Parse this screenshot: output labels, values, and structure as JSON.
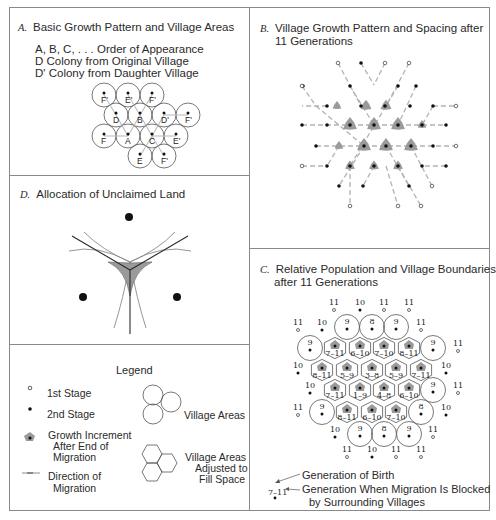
{
  "colors": {
    "border": "#8a8a8a",
    "ink": "#1e1e1e",
    "arrow": "#a6a6a6",
    "shade": "#9a9a9a",
    "circle": "#555555"
  },
  "panel_a": {
    "letter": "A.",
    "title": "Basic Growth Pattern and Village Areas",
    "lines": [
      "A, B, C, . . . Order of Appearance",
      "D Colony from Original Village",
      "D' Colony from Daughter Village"
    ],
    "villages": [
      {
        "label": "F'",
        "x": 104,
        "y": 95
      },
      {
        "label": "E'",
        "x": 128,
        "y": 95
      },
      {
        "label": "F'",
        "x": 152,
        "y": 95
      },
      {
        "label": "D",
        "x": 116,
        "y": 115
      },
      {
        "label": "B",
        "x": 140,
        "y": 115
      },
      {
        "label": "D'",
        "x": 164,
        "y": 115
      },
      {
        "label": "F'",
        "x": 188,
        "y": 115
      },
      {
        "label": "F",
        "x": 104,
        "y": 136
      },
      {
        "label": "A",
        "x": 128,
        "y": 136
      },
      {
        "label": "C",
        "x": 152,
        "y": 136
      },
      {
        "label": "E'",
        "x": 176,
        "y": 136
      },
      {
        "label": "E",
        "x": 140,
        "y": 156
      },
      {
        "label": "F'",
        "x": 164,
        "y": 156
      }
    ]
  },
  "panel_b": {
    "letter": "B.",
    "title_line1": "Village Growth Pattern and Spacing after",
    "title_line2": "11 Generations"
  },
  "panel_c": {
    "letter": "C.",
    "title_line1": "Relative Population and Village Boundaries",
    "title_line2": "after 11 Generations",
    "outer": [
      {
        "label": "11",
        "x": 334,
        "y": 307,
        "stage": 1
      },
      {
        "label": "10",
        "x": 360,
        "y": 307,
        "stage": 2
      },
      {
        "label": "11",
        "x": 384,
        "y": 307,
        "stage": 1
      },
      {
        "label": "11",
        "x": 409,
        "y": 307,
        "stage": 1
      },
      {
        "label": "11",
        "x": 298,
        "y": 327,
        "stage": 1
      },
      {
        "label": "10",
        "x": 322,
        "y": 327,
        "stage": 2
      },
      {
        "label": "11",
        "x": 421,
        "y": 327,
        "stage": 1
      },
      {
        "label": "11",
        "x": 458,
        "y": 348,
        "stage": 1
      },
      {
        "label": "10",
        "x": 298,
        "y": 370,
        "stage": 2
      },
      {
        "label": "10",
        "x": 446,
        "y": 370,
        "stage": 2
      },
      {
        "label": "10",
        "x": 310,
        "y": 390,
        "stage": 2
      },
      {
        "label": "11",
        "x": 458,
        "y": 390,
        "stage": 1
      },
      {
        "label": "11",
        "x": 298,
        "y": 412,
        "stage": 1
      },
      {
        "label": "10",
        "x": 446,
        "y": 412,
        "stage": 2
      },
      {
        "label": "10",
        "x": 335,
        "y": 434,
        "stage": 2
      },
      {
        "label": "11",
        "x": 433,
        "y": 434,
        "stage": 1
      },
      {
        "label": "11",
        "x": 347,
        "y": 454,
        "stage": 1
      },
      {
        "label": "10",
        "x": 372,
        "y": 454,
        "stage": 2
      },
      {
        "label": "11",
        "x": 396,
        "y": 454,
        "stage": 1
      },
      {
        "label": "11",
        "x": 421,
        "y": 454,
        "stage": 1
      }
    ],
    "circles": [
      {
        "label": "9",
        "x": 347,
        "y": 327
      },
      {
        "label": "8",
        "x": 372,
        "y": 327
      },
      {
        "label": "9",
        "x": 396,
        "y": 327
      },
      {
        "label": "9",
        "x": 310,
        "y": 348
      },
      {
        "label": "9",
        "x": 433,
        "y": 348
      },
      {
        "label": "9",
        "x": 433,
        "y": 390
      },
      {
        "label": "9",
        "x": 322,
        "y": 412
      },
      {
        "label": "8",
        "x": 421,
        "y": 412
      },
      {
        "label": "9",
        "x": 360,
        "y": 434
      },
      {
        "label": "8",
        "x": 384,
        "y": 434
      },
      {
        "label": "9",
        "x": 409,
        "y": 434
      }
    ],
    "hexes": [
      {
        "label": "7–11",
        "x": 335,
        "y": 348
      },
      {
        "label": "6–10",
        "x": 360,
        "y": 348
      },
      {
        "label": "7–10",
        "x": 384,
        "y": 348
      },
      {
        "label": "8–11",
        "x": 409,
        "y": 348
      },
      {
        "label": "8–11",
        "x": 322,
        "y": 370
      },
      {
        "label": "5–9",
        "x": 347,
        "y": 370
      },
      {
        "label": "3–8",
        "x": 372,
        "y": 370
      },
      {
        "label": "5–9",
        "x": 396,
        "y": 370
      },
      {
        "label": "7–11",
        "x": 421,
        "y": 370
      },
      {
        "label": "7–11",
        "x": 335,
        "y": 390
      },
      {
        "label": "1–9",
        "x": 360,
        "y": 390
      },
      {
        "label": "4–8",
        "x": 384,
        "y": 390
      },
      {
        "label": "6–10",
        "x": 409,
        "y": 390
      },
      {
        "label": "8–11",
        "x": 347,
        "y": 412
      },
      {
        "label": "6–10",
        "x": 372,
        "y": 412
      },
      {
        "label": "7–10",
        "x": 396,
        "y": 412
      }
    ],
    "key_example": "7–11",
    "key_birth": "Generation of Birth",
    "key_blocked_line1": "Generation When Migration Is Blocked",
    "key_blocked_line2": "by Surrounding Villages"
  },
  "panel_d": {
    "letter": "D.",
    "title": "Allocation of Unclaimed Land"
  },
  "legend": {
    "title": "Legend",
    "first_stage": "1st Stage",
    "second_stage": "2nd Stage",
    "growth_line1": "Growth Increment",
    "growth_line2": "After End of",
    "growth_line3": "Migration",
    "direction_line1": "Direction of",
    "direction_line2": "Migration",
    "village_areas": "Village Areas",
    "adjusted_line1": "Village Areas",
    "adjusted_line2": "Adjusted to",
    "adjusted_line3": "Fill Space"
  }
}
